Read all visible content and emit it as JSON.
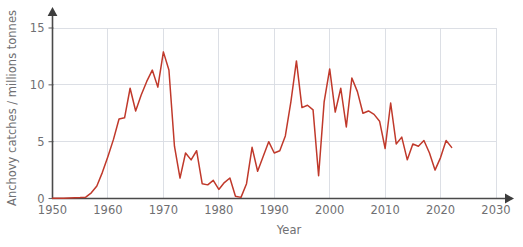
{
  "chart_data": {
    "type": "line",
    "title": "",
    "xlabel": "Year",
    "ylabel": "Anchovy catches / millions tonnes",
    "xlim": [
      1950,
      2030
    ],
    "ylim": [
      0,
      15.8
    ],
    "grid": true,
    "legend": null,
    "x_ticks": [
      1950,
      1960,
      1970,
      1980,
      1990,
      2000,
      2010,
      2020,
      2030
    ],
    "x_tick_labels": [
      "1950",
      "1960",
      "1970",
      "1980",
      "1990",
      "2000",
      "2010",
      "2020",
      "2030"
    ],
    "y_ticks": [
      0,
      5,
      10,
      15
    ],
    "y_tick_labels": [
      "0",
      "5",
      "10",
      "15"
    ],
    "series": [
      {
        "name": "Anchovy catches",
        "color": "#c0392b",
        "x": [
          1950,
          1951,
          1952,
          1953,
          1954,
          1955,
          1956,
          1957,
          1958,
          1959,
          1960,
          1961,
          1962,
          1963,
          1964,
          1965,
          1966,
          1967,
          1968,
          1969,
          1970,
          1971,
          1972,
          1973,
          1974,
          1975,
          1976,
          1977,
          1978,
          1979,
          1980,
          1981,
          1982,
          1983,
          1984,
          1985,
          1986,
          1987,
          1988,
          1989,
          1990,
          1991,
          1992,
          1993,
          1994,
          1995,
          1996,
          1997,
          1998,
          1999,
          2000,
          2001,
          2002,
          2003,
          2004,
          2005,
          2006,
          2007,
          2008,
          2009,
          2010,
          2011,
          2012,
          2013,
          2014,
          2015,
          2016,
          2017,
          2018,
          2019,
          2020,
          2021,
          2022
        ],
        "y": [
          0.02,
          0.02,
          0.03,
          0.05,
          0.06,
          0.08,
          0.12,
          0.5,
          1.1,
          2.3,
          3.7,
          5.2,
          7.0,
          7.1,
          9.7,
          7.7,
          9.1,
          10.3,
          11.3,
          9.8,
          12.9,
          11.3,
          4.6,
          1.8,
          4.0,
          3.4,
          4.2,
          1.3,
          1.2,
          1.6,
          0.8,
          1.4,
          1.8,
          0.2,
          0.1,
          1.3,
          4.5,
          2.4,
          3.7,
          5.0,
          4.0,
          4.2,
          5.5,
          8.5,
          12.1,
          8.0,
          8.2,
          7.8,
          2.0,
          8.5,
          11.4,
          7.6,
          9.7,
          6.3,
          10.6,
          9.4,
          7.5,
          7.7,
          7.4,
          6.8,
          4.4,
          8.4,
          4.8,
          5.4,
          3.4,
          4.8,
          4.6,
          5.1,
          4.0,
          2.5,
          3.6,
          5.1,
          4.5
        ]
      }
    ]
  },
  "axes": {
    "y_label": "Anchovy catches / millions tonnes",
    "x_label": "Year"
  },
  "colors": {
    "line": "#c0392b",
    "grid": "#d8dce2",
    "axis": "#4a4a4a",
    "text": "#6f6f72",
    "background": "#ffffff"
  }
}
